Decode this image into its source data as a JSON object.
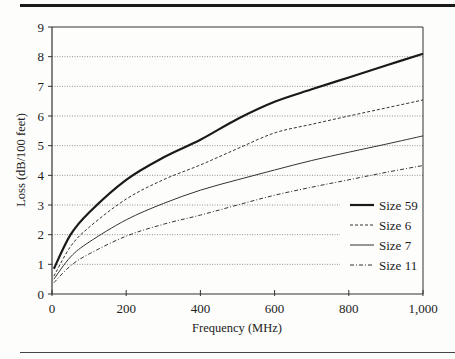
{
  "chart_data": {
    "type": "line",
    "title": "",
    "xlabel": "Frequency (MHz)",
    "ylabel": "Loss (dB/100 feet)",
    "xlim": [
      0,
      1000
    ],
    "ylim": [
      0,
      9
    ],
    "x_ticks": [
      0,
      200,
      400,
      600,
      800,
      1000
    ],
    "x_tick_labels": [
      "0",
      "200",
      "400",
      "600",
      "800",
      "1,000"
    ],
    "y_ticks": [
      0,
      1,
      2,
      3,
      4,
      5,
      6,
      7,
      8,
      9
    ],
    "y_tick_labels": [
      "0",
      "1",
      "2",
      "3",
      "4",
      "5",
      "6",
      "7",
      "8",
      "9"
    ],
    "grid": "horizontal dotted",
    "legend_position": "lower right (inside plot)",
    "x": [
      5,
      50,
      100,
      200,
      300,
      400,
      500,
      600,
      700,
      800,
      900,
      1000
    ],
    "series": [
      {
        "name": "Size 59",
        "style": "solid-thick",
        "values": [
          0.85,
          2.0,
          2.75,
          3.85,
          4.6,
          5.2,
          5.9,
          6.48,
          6.9,
          7.3,
          7.7,
          8.1
        ]
      },
      {
        "name": "Size 6",
        "style": "dashed",
        "values": [
          0.6,
          1.6,
          2.25,
          3.2,
          3.85,
          4.35,
          4.9,
          5.43,
          5.72,
          6.0,
          6.27,
          6.54
        ]
      },
      {
        "name": "Size 7",
        "style": "solid-thin",
        "values": [
          0.5,
          1.25,
          1.75,
          2.5,
          3.05,
          3.5,
          3.85,
          4.18,
          4.5,
          4.78,
          5.05,
          5.33
        ]
      },
      {
        "name": "Size 11",
        "style": "dash-dot",
        "values": [
          0.38,
          0.95,
          1.35,
          1.95,
          2.35,
          2.66,
          3.0,
          3.33,
          3.6,
          3.85,
          4.1,
          4.33
        ]
      }
    ]
  },
  "legend": {
    "items": [
      {
        "label": "Size 59"
      },
      {
        "label": "Size 6"
      },
      {
        "label": "Size 7"
      },
      {
        "label": "Size 11"
      }
    ]
  }
}
